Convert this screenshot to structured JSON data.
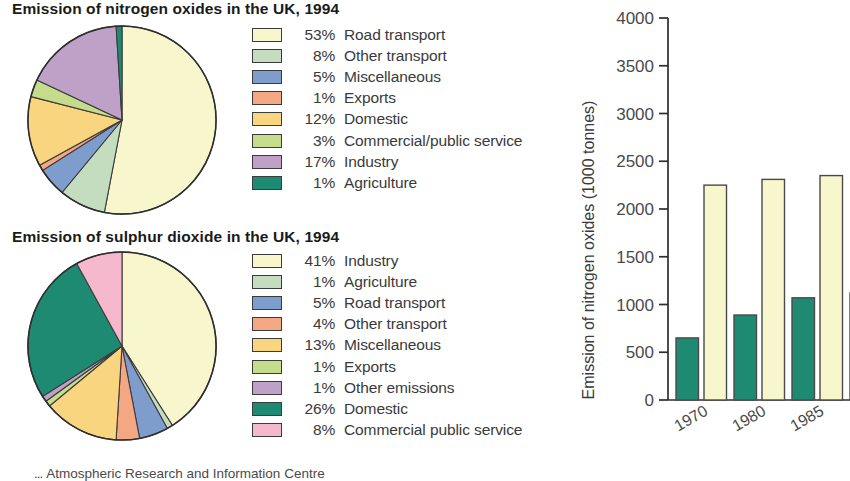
{
  "source_note": {
    "mark": "...",
    "text": "Atmospheric Research and Information Centre"
  },
  "palette": {
    "cream": "#f7f6cd",
    "pale_green": "#c3ddbe",
    "blue": "#7e9ccc",
    "salmon": "#f4a783",
    "amber": "#fad57f",
    "yellow_green": "#c4dc8c",
    "purple": "#bfa1c8",
    "teal": "#1f8a72",
    "pink": "#f5b8cd",
    "outline": "#3b3b3b",
    "axis": "#2e2e2e",
    "text": "#3a3a3a"
  },
  "charts": {
    "nox_pie": {
      "title": "Emission of nitrogen oxides in the UK, 1994",
      "legend": [
        {
          "pct": "53%",
          "label": "Road transport",
          "color": "#f7f6cd"
        },
        {
          "pct": "8%",
          "label": "Other transport",
          "color": "#c3ddbe"
        },
        {
          "pct": "5%",
          "label": "Miscellaneous",
          "color": "#7e9ccc"
        },
        {
          "pct": "1%",
          "label": "Exports",
          "color": "#f4a783"
        },
        {
          "pct": "12%",
          "label": "Domestic",
          "color": "#fad57f"
        },
        {
          "pct": "3%",
          "label": "Commercial/public service",
          "color": "#c4dc8c"
        },
        {
          "pct": "17%",
          "label": "Industry",
          "color": "#bfa1c8"
        },
        {
          "pct": "1%",
          "label": "Agriculture",
          "color": "#1f8a72"
        }
      ]
    },
    "so2_pie": {
      "title": "Emission of sulphur dioxide in the UK, 1994",
      "legend": [
        {
          "pct": "41%",
          "label": "Industry",
          "color": "#f7f6cd"
        },
        {
          "pct": "1%",
          "label": "Agriculture",
          "color": "#c3ddbe"
        },
        {
          "pct": "5%",
          "label": "Road transport",
          "color": "#7e9ccc"
        },
        {
          "pct": "4%",
          "label": "Other transport",
          "color": "#f4a783"
        },
        {
          "pct": "13%",
          "label": "Miscellaneous",
          "color": "#fad57f"
        },
        {
          "pct": "1%",
          "label": "Exports",
          "color": "#c4dc8c"
        },
        {
          "pct": "1%",
          "label": "Other emissions",
          "color": "#bfa1c8"
        },
        {
          "pct": "26%",
          "label": "Domestic",
          "color": "#1f8a72"
        },
        {
          "pct": "8%",
          "label": "Commercial public service",
          "color": "#f5b8cd"
        }
      ]
    },
    "bar": {
      "ylabel": "Emission of nitrogen oxides (1000 tonnes)",
      "yticks": [
        "4000",
        "3500",
        "3000",
        "2500",
        "2000",
        "1500",
        "1000",
        "500",
        "0"
      ],
      "xticks": [
        "1970",
        "1980",
        "1985",
        "19"
      ]
    }
  },
  "chart_data": [
    {
      "type": "pie",
      "title": "Emission of nitrogen oxides in the UK, 1994",
      "labels": [
        "Road transport",
        "Other transport",
        "Miscellaneous",
        "Exports",
        "Domestic",
        "Commercial/public service",
        "Industry",
        "Agriculture"
      ],
      "values": [
        53,
        8,
        5,
        1,
        12,
        3,
        17,
        1
      ],
      "unit": "percent",
      "colors": [
        "#f7f6cd",
        "#c3ddbe",
        "#7e9ccc",
        "#f4a783",
        "#fad57f",
        "#c4dc8c",
        "#bfa1c8",
        "#1f8a72"
      ],
      "start_angle_deg": 0,
      "direction": "clockwise",
      "legend_position": "right"
    },
    {
      "type": "pie",
      "title": "Emission of sulphur dioxide in the UK, 1994",
      "labels": [
        "Industry",
        "Agriculture",
        "Road transport",
        "Other transport",
        "Miscellaneous",
        "Exports",
        "Other emissions",
        "Domestic",
        "Commercial public service"
      ],
      "values": [
        41,
        1,
        5,
        4,
        13,
        1,
        1,
        26,
        8
      ],
      "unit": "percent",
      "colors": [
        "#f7f6cd",
        "#c3ddbe",
        "#7e9ccc",
        "#f4a783",
        "#fad57f",
        "#c4dc8c",
        "#bfa1c8",
        "#1f8a72",
        "#f5b8cd"
      ],
      "start_angle_deg": 0,
      "direction": "clockwise",
      "legend_position": "right"
    },
    {
      "type": "bar",
      "title": "",
      "xlabel": "",
      "ylabel": "Emission of nitrogen oxides (1000 tonnes)",
      "categories": [
        "1970",
        "1980",
        "1985",
        "1990"
      ],
      "series": [
        {
          "name": "series-green",
          "color": "#1f8a72",
          "values": [
            650,
            890,
            1070,
            1120
          ]
        },
        {
          "name": "series-cream",
          "color": "#f7f6cd",
          "values": [
            2250,
            2310,
            2350,
            null
          ]
        }
      ],
      "ylim": [
        0,
        4000
      ],
      "ytick_step": 500,
      "grid": false,
      "note": "rightmost 1990 group is clipped by the image edge"
    }
  ]
}
